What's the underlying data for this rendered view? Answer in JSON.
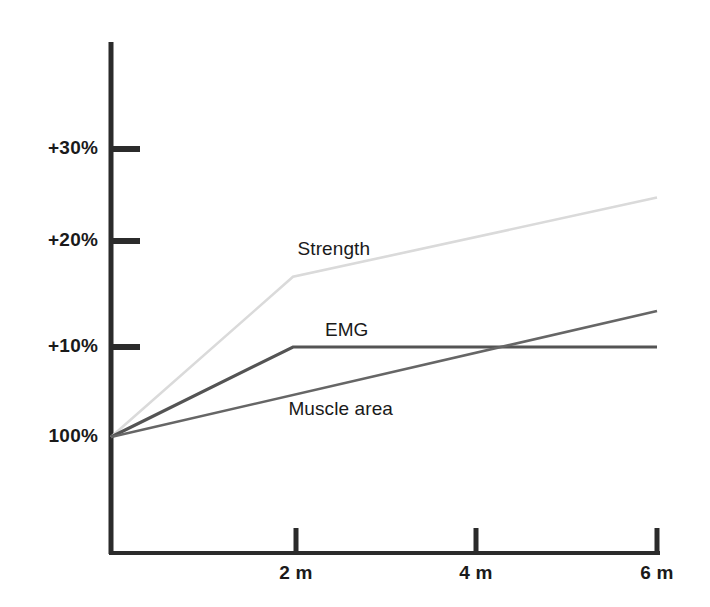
{
  "chart_data": {
    "type": "line",
    "title": "",
    "subtitle": "",
    "xlabel": "",
    "ylabel": "",
    "grid": false,
    "legend": "inline-labels",
    "x": [
      0,
      2,
      4,
      6
    ],
    "x_tick_labels": [
      "2 m",
      "4 m",
      "6 m"
    ],
    "x_tick_values": [
      2,
      4,
      6
    ],
    "xlim": [
      0,
      6.05
    ],
    "y_tick_labels": [
      "100%",
      "+10%",
      "+20%",
      "+30%"
    ],
    "y_tick_values": [
      0,
      10,
      20,
      30
    ],
    "ylim": [
      -13,
      36
    ],
    "y_unit": "% change from baseline (100%)",
    "series": [
      {
        "name": "Strength",
        "color": "#dadada",
        "x": [
          0,
          2,
          6
        ],
        "values": [
          0,
          17.8,
          26.6
        ],
        "label_x": 2.05,
        "label_y": 20.8
      },
      {
        "name": "EMG",
        "color": "#545454",
        "x": [
          0,
          2,
          6
        ],
        "values": [
          0,
          10,
          10
        ],
        "label_x": 2.35,
        "label_y": 11.8
      },
      {
        "name": "Muscle area",
        "color": "#666666",
        "x": [
          0,
          6
        ],
        "values": [
          0,
          14.0
        ],
        "label_x": 1.95,
        "label_y": 3.0
      }
    ]
  },
  "axis": {
    "axis_color": "#2b2b2b",
    "tick_color": "#2b2b2b"
  },
  "y_ticks": [
    {
      "label": "+30%",
      "value": 30
    },
    {
      "label": "+20%",
      "value": 20
    },
    {
      "label": "+10%",
      "value": 10
    },
    {
      "label": "100%",
      "value": 0
    }
  ],
  "x_ticks": [
    {
      "label": "2 m",
      "value": 2
    },
    {
      "label": "4 m",
      "value": 4
    },
    {
      "label": "6 m",
      "value": 6
    }
  ],
  "series_labels": [
    {
      "label": "Strength"
    },
    {
      "label": "EMG"
    },
    {
      "label": "Muscle area"
    }
  ]
}
